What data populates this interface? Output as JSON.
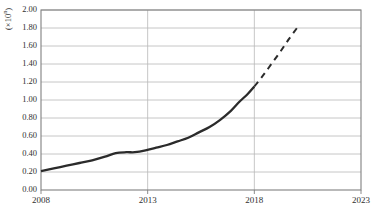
{
  "chart_data": {
    "type": "line",
    "title": "",
    "subtitle": "",
    "xlabel": "",
    "ylabel": "(×10ⁿ)",
    "ylabel_text": "(×10n)",
    "xlim": [
      2008,
      2023
    ],
    "ylim": [
      0.0,
      2.0
    ],
    "grid": "horizontal",
    "legend_position": "none",
    "x_ticks": [
      "2008",
      "2013",
      "2018",
      "2023"
    ],
    "x_tick_values": [
      2008,
      2013,
      2018,
      2023
    ],
    "y_ticks": [
      "0.00",
      "0.20",
      "0.40",
      "0.60",
      "0.80",
      "1.00",
      "1.20",
      "1.40",
      "1.60",
      "1.80",
      "2.00"
    ],
    "y_tick_values": [
      0.0,
      0.2,
      0.4,
      0.6,
      0.8,
      1.0,
      1.2,
      1.4,
      1.6,
      1.8,
      2.0
    ],
    "series": [
      {
        "name": "historical",
        "style": "solid",
        "color": "#2b2b2b",
        "x": [
          2008,
          2008.6,
          2009.2,
          2009.8,
          2010.4,
          2011.0,
          2011.5,
          2012.0,
          2012.4,
          2012.9,
          2013.4,
          2013.9,
          2014.4,
          2014.9,
          2015.4,
          2015.9,
          2016.4,
          2016.9,
          2017.3,
          2017.7,
          2018.0
        ],
        "values": [
          0.21,
          0.24,
          0.27,
          0.3,
          0.33,
          0.37,
          0.41,
          0.42,
          0.42,
          0.44,
          0.47,
          0.5,
          0.54,
          0.58,
          0.64,
          0.7,
          0.78,
          0.88,
          0.98,
          1.07,
          1.15
        ]
      },
      {
        "name": "projection",
        "style": "dashed",
        "color": "#2b2b2b",
        "x": [
          2018.0,
          2018.4,
          2018.8,
          2019.2,
          2019.6,
          2020.0
        ],
        "values": [
          1.15,
          1.27,
          1.4,
          1.53,
          1.67,
          1.8
        ]
      }
    ],
    "annotations": [],
    "axis_color": "#808080",
    "grid_color": "#b8b8b8"
  },
  "axis": {
    "y_unit_prefix": "(×10",
    "y_unit_exponent": "n",
    "y_unit_suffix": ")"
  }
}
